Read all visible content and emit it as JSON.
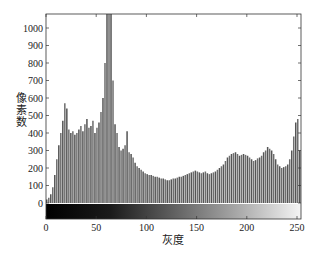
{
  "chart_data": {
    "type": "bar",
    "title": "",
    "xlabel": "灰度",
    "ylabel": "像素数",
    "xlim": [
      0,
      256
    ],
    "ylim": [
      0,
      1080
    ],
    "grid": false,
    "legend": null,
    "x_ticks": [
      0,
      50,
      100,
      150,
      200,
      250
    ],
    "y_ticks": [
      0,
      100,
      200,
      300,
      400,
      500,
      600,
      700,
      800,
      900,
      1000
    ],
    "colorbar": {
      "position": "below-axis",
      "from": "#000000",
      "to": "#ffffff",
      "description": "grayscale gradient 0-255"
    },
    "bar_color": "#6e6e6e",
    "x": [
      0,
      2,
      4,
      6,
      8,
      10,
      12,
      14,
      16,
      18,
      20,
      22,
      24,
      26,
      28,
      30,
      32,
      34,
      36,
      38,
      40,
      42,
      44,
      46,
      48,
      50,
      52,
      54,
      56,
      58,
      60,
      62,
      64,
      66,
      68,
      70,
      72,
      74,
      76,
      78,
      80,
      82,
      84,
      86,
      88,
      90,
      92,
      94,
      96,
      98,
      100,
      102,
      104,
      106,
      108,
      110,
      112,
      114,
      116,
      118,
      120,
      122,
      124,
      126,
      128,
      130,
      132,
      134,
      136,
      138,
      140,
      142,
      144,
      146,
      148,
      150,
      152,
      154,
      156,
      158,
      160,
      162,
      164,
      166,
      168,
      170,
      172,
      174,
      176,
      178,
      180,
      182,
      184,
      186,
      188,
      190,
      192,
      194,
      196,
      198,
      200,
      202,
      204,
      206,
      208,
      210,
      212,
      214,
      216,
      218,
      220,
      222,
      224,
      226,
      228,
      230,
      232,
      234,
      236,
      238,
      240,
      242,
      244,
      246,
      248,
      250,
      252,
      254
    ],
    "values": [
      20,
      30,
      50,
      90,
      160,
      250,
      330,
      400,
      470,
      570,
      540,
      420,
      400,
      410,
      390,
      400,
      420,
      440,
      410,
      450,
      480,
      430,
      440,
      470,
      400,
      430,
      460,
      520,
      600,
      800,
      1100,
      1100,
      1100,
      700,
      450,
      400,
      320,
      300,
      310,
      330,
      410,
      290,
      280,
      260,
      230,
      210,
      200,
      190,
      180,
      170,
      165,
      160,
      160,
      155,
      150,
      150,
      145,
      140,
      140,
      135,
      130,
      130,
      135,
      140,
      140,
      145,
      150,
      150,
      155,
      160,
      165,
      170,
      175,
      180,
      185,
      180,
      175,
      170,
      175,
      180,
      170,
      165,
      170,
      175,
      180,
      190,
      200,
      210,
      220,
      240,
      260,
      270,
      280,
      285,
      290,
      280,
      270,
      275,
      280,
      275,
      270,
      260,
      250,
      240,
      245,
      255,
      260,
      270,
      290,
      300,
      320,
      310,
      300,
      280,
      250,
      220,
      210,
      200,
      205,
      210,
      220,
      250,
      300,
      380,
      460,
      480,
      300,
      120
    ]
  },
  "axes": {
    "xlabel": "灰度",
    "ylabel": "像素数",
    "x_tick_labels": [
      "0",
      "50",
      "100",
      "150",
      "200",
      "250"
    ],
    "y_tick_labels": [
      "0",
      "100",
      "200",
      "300",
      "400",
      "500",
      "600",
      "700",
      "800",
      "900",
      "1000"
    ]
  }
}
